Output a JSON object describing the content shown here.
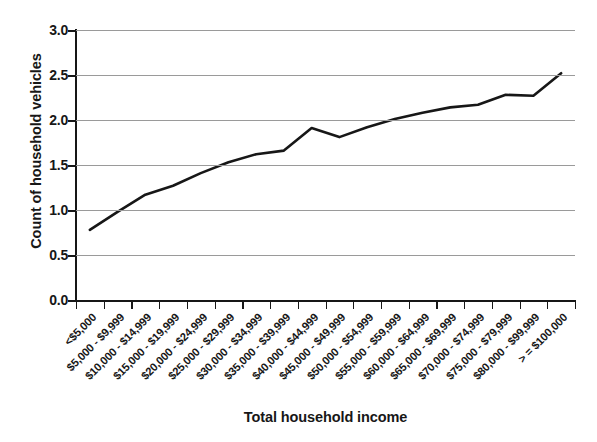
{
  "chart_data": {
    "type": "line",
    "title": "",
    "xlabel": "Total household income",
    "ylabel": "Count of household vehicles",
    "ylim": [
      0.0,
      3.0
    ],
    "y_ticks": [
      "0.0",
      "0.5",
      "1.0",
      "1.5",
      "2.0",
      "2.5",
      "3.0"
    ],
    "y_tick_values": [
      0.0,
      0.5,
      1.0,
      1.5,
      2.0,
      2.5,
      3.0
    ],
    "grid": "horizontal",
    "legend": "none",
    "line_color": "#171717",
    "categories": [
      "<$5,000",
      "$5,000 - $9,999",
      "$10,000 - $14,999",
      "$15,000 - $19,999",
      "$20,000 - $24,999",
      "$25,000 - $29,999",
      "$30,000 - $34,999",
      "$35,000 - $39,999",
      "$40,000 - $44,999",
      "$45,000 - $49,999",
      "$50,000 - $54,999",
      "$55,000 - $59,999",
      "$60,000 - $64,999",
      "$65,000 - $69,999",
      "$70,000 - $74,999",
      "$75,000 - $79,999",
      "$80,000 - $99,999",
      "> = $100,000"
    ],
    "values": [
      0.78,
      0.98,
      1.17,
      1.27,
      1.41,
      1.53,
      1.62,
      1.66,
      1.91,
      1.81,
      1.92,
      2.01,
      2.08,
      2.14,
      2.17,
      2.28,
      2.27,
      2.52
    ]
  }
}
